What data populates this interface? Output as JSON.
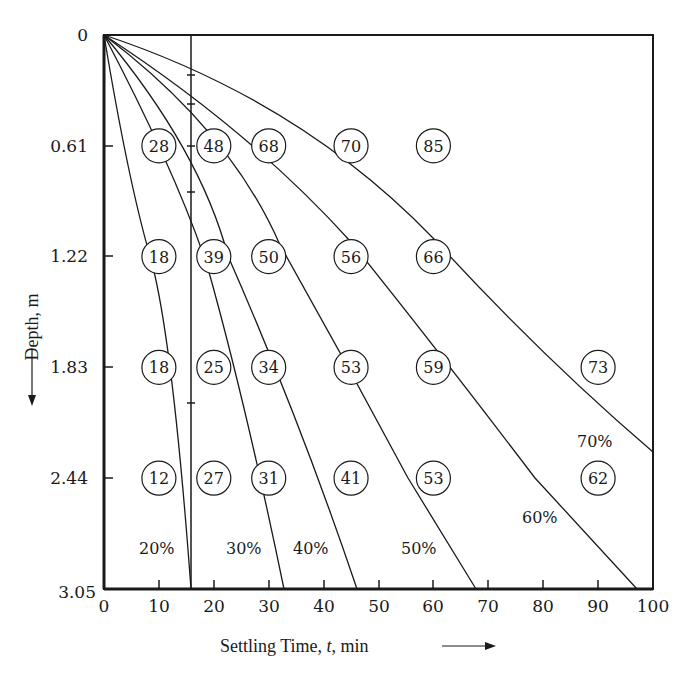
{
  "chart_data": {
    "type": "line",
    "title": "",
    "xlabel": "Settling Time, t, min",
    "ylabel": "Depth, m",
    "xlim": [
      0,
      100
    ],
    "ylim": [
      3.05,
      0
    ],
    "y_inverted": true,
    "grid": false,
    "x_ticks": [
      0,
      10,
      20,
      30,
      40,
      50,
      60,
      70,
      80,
      90,
      100
    ],
    "y_ticks": [
      "0",
      "0.61",
      "1.22",
      "1.83",
      "2.44",
      "3.05"
    ],
    "observations": {
      "description": "Percent removal measured at each depth and time (circled values)",
      "times": [
        10,
        20,
        30,
        45,
        60,
        90
      ],
      "rows": [
        {
          "depth": 0.61,
          "values": {
            "10": 28,
            "20": 48,
            "30": 68,
            "45": 70,
            "60": 85
          }
        },
        {
          "depth": 1.22,
          "values": {
            "10": 18,
            "20": 39,
            "30": 50,
            "45": 56,
            "60": 66
          }
        },
        {
          "depth": 1.83,
          "values": {
            "10": 18,
            "20": 25,
            "30": 34,
            "45": 53,
            "60": 59,
            "90": 73
          }
        },
        {
          "depth": 2.44,
          "values": {
            "10": 12,
            "20": 27,
            "30": 31,
            "45": 41,
            "60": 53,
            "90": 62
          }
        }
      ]
    },
    "series": [
      {
        "name": "20%",
        "label": "20%",
        "end_time_at_bottom": 16.2
      },
      {
        "name": "30%",
        "label": "30%",
        "end_time_at_bottom": 32.8
      },
      {
        "name": "40%",
        "label": "40%",
        "end_time_at_bottom": 46.1
      },
      {
        "name": "50%",
        "label": "50%",
        "end_time_at_bottom": 67.8
      },
      {
        "name": "60%",
        "label": "60%",
        "end_time_at_bottom": 97.1
      },
      {
        "name": "70%",
        "label": "70%",
        "end_depth_at_t100": 2.3
      }
    ],
    "reference_line": {
      "t": 16.2,
      "description": "vertical line from 0 to 3.05 m with tick marks at curve intersections"
    },
    "annotations": [
      "20%",
      "30%",
      "40%",
      "50%",
      "60%",
      "70%"
    ]
  },
  "axes": {
    "x_tick_labels": [
      "0",
      "10",
      "20",
      "30",
      "40",
      "50",
      "60",
      "70",
      "80",
      "90",
      "100"
    ],
    "y_tick_labels": [
      "0",
      "0.61",
      "1.22",
      "1.83",
      "2.44",
      "3.05"
    ],
    "x_title": "Settling Time, ",
    "x_title_italic": "t",
    "x_title_tail": ", min",
    "y_title": "Depth, m"
  },
  "circles": [
    {
      "t": 10,
      "d": 0.61,
      "v": "28"
    },
    {
      "t": 20,
      "d": 0.61,
      "v": "48"
    },
    {
      "t": 30,
      "d": 0.61,
      "v": "68"
    },
    {
      "t": 45,
      "d": 0.61,
      "v": "70"
    },
    {
      "t": 60,
      "d": 0.61,
      "v": "85"
    },
    {
      "t": 10,
      "d": 1.22,
      "v": "18"
    },
    {
      "t": 20,
      "d": 1.22,
      "v": "39"
    },
    {
      "t": 30,
      "d": 1.22,
      "v": "50"
    },
    {
      "t": 45,
      "d": 1.22,
      "v": "56"
    },
    {
      "t": 60,
      "d": 1.22,
      "v": "66"
    },
    {
      "t": 10,
      "d": 1.83,
      "v": "18"
    },
    {
      "t": 20,
      "d": 1.83,
      "v": "25"
    },
    {
      "t": 30,
      "d": 1.83,
      "v": "34"
    },
    {
      "t": 45,
      "d": 1.83,
      "v": "53"
    },
    {
      "t": 60,
      "d": 1.83,
      "v": "59"
    },
    {
      "t": 90,
      "d": 1.83,
      "v": "73"
    },
    {
      "t": 10,
      "d": 2.44,
      "v": "12"
    },
    {
      "t": 20,
      "d": 2.44,
      "v": "27"
    },
    {
      "t": 30,
      "d": 2.44,
      "v": "31"
    },
    {
      "t": 45,
      "d": 2.44,
      "v": "41"
    },
    {
      "t": 60,
      "d": 2.44,
      "v": "53"
    },
    {
      "t": 90,
      "d": 2.44,
      "v": "62"
    }
  ],
  "curve_labels": {
    "p20": "20%",
    "p30": "30%",
    "p40": "40%",
    "p50": "50%",
    "p60": "60%",
    "p70": "70%"
  },
  "colors": {
    "ink": "#1a1a1a",
    "background": "#ffffff"
  }
}
